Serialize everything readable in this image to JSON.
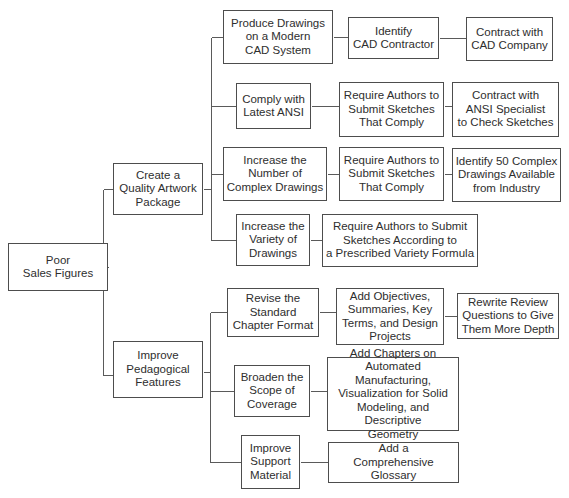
{
  "diagram": {
    "type": "tree",
    "root": "n0",
    "nodes": [
      {
        "id": "n0",
        "label": "Poor\nSales Figures",
        "parent": null
      },
      {
        "id": "n1",
        "label": "Create a\nQuality Artwork\nPackage",
        "parent": "n0"
      },
      {
        "id": "n2",
        "label": "Improve\nPedagogical\nFeatures",
        "parent": "n0"
      },
      {
        "id": "n3",
        "label": "Produce Drawings\non a Modern\nCAD System",
        "parent": "n1"
      },
      {
        "id": "n4",
        "label": "Identify\nCAD Contractor",
        "parent": "n3"
      },
      {
        "id": "n5",
        "label": "Contract with\nCAD Company",
        "parent": "n4"
      },
      {
        "id": "n6",
        "label": "Comply with\nLatest ANSI",
        "parent": "n1"
      },
      {
        "id": "n7",
        "label": "Require Authors to\nSubmit Sketches\nThat Comply",
        "parent": "n6"
      },
      {
        "id": "n8",
        "label": "Contract with\nANSI Specialist\nto Check Sketches",
        "parent": "n7"
      },
      {
        "id": "n9",
        "label": "Increase the\nNumber of\nComplex Drawings",
        "parent": "n1"
      },
      {
        "id": "n10",
        "label": "Require Authors to\nSubmit Sketches\nThat Comply",
        "parent": "n9"
      },
      {
        "id": "n11",
        "label": "Identify 50 Complex\nDrawings Available\nfrom Industry",
        "parent": "n10"
      },
      {
        "id": "n12",
        "label": "Increase the\nVariety of\nDrawings",
        "parent": "n1"
      },
      {
        "id": "n13",
        "label": "Require Authors to Submit\nSketches According to\na Prescribed Variety Formula",
        "parent": "n12"
      },
      {
        "id": "n14",
        "label": "Revise the\nStandard\nChapter Format",
        "parent": "n2"
      },
      {
        "id": "n15",
        "label": "Add Objectives,\nSummaries, Key\nTerms, and Design\nProjects",
        "parent": "n14"
      },
      {
        "id": "n16",
        "label": "Rewrite Review\nQuestions to Give\nThem More Depth",
        "parent": "n15"
      },
      {
        "id": "n17",
        "label": "Broaden the\nScope of\nCoverage",
        "parent": "n2"
      },
      {
        "id": "n18",
        "label": "Add Chapters on\nAutomated Manufacturing,\nVisualization for Solid\nModeling, and Descriptive\nGeometry",
        "parent": "n17"
      },
      {
        "id": "n19",
        "label": "Improve\nSupport\nMaterial",
        "parent": "n2"
      },
      {
        "id": "n20",
        "label": "Add a\nComprehensive Glossary",
        "parent": "n19"
      }
    ]
  }
}
